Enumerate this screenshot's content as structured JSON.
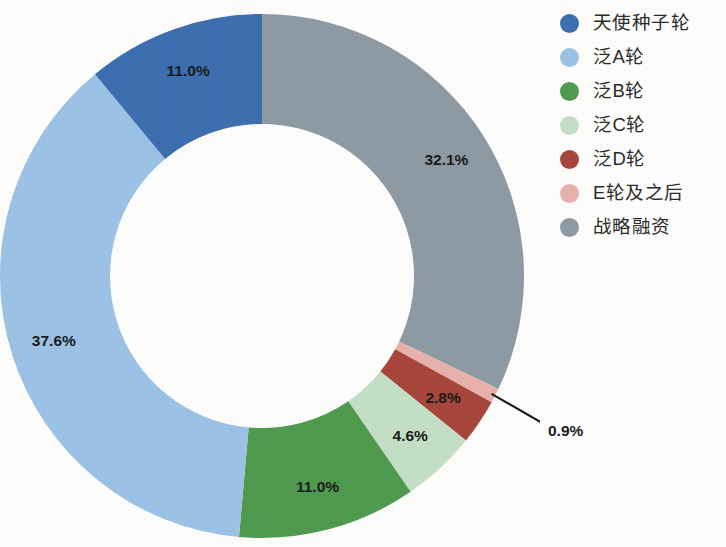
{
  "chart_data": {
    "type": "pie",
    "variant": "donut",
    "title": "",
    "subtitle": "",
    "xlabel": "",
    "ylabel": "",
    "grid": false,
    "legend_position": "right",
    "start_angle_deg": 0,
    "direction": "clockwise",
    "value_unit": "%",
    "center": {
      "x": 262,
      "y": 276
    },
    "outer_radius": 262,
    "inner_radius": 152,
    "categories": [
      "天使种子轮",
      "泛A轮",
      "泛B轮",
      "泛C轮",
      "泛D轮",
      "E轮及之后",
      "战略融资"
    ],
    "values": [
      11.0,
      37.6,
      11.0,
      4.6,
      2.8,
      0.9,
      32.1
    ],
    "labels": [
      "11.0%",
      "37.6%",
      "11.0%",
      "4.6%",
      "2.8%",
      "0.9%",
      "32.1%"
    ],
    "colors": [
      "#3d6fb0",
      "#9cc3e6",
      "#4f9b4f",
      "#c3e0c6",
      "#a8463c",
      "#e8b1ab",
      "#8e9aa4"
    ],
    "slices": [
      {
        "name": "战略融资",
        "value": 32.1,
        "label": "32.1%",
        "color": "#8e9aa4",
        "label_placement": "inside"
      },
      {
        "name": "E轮及之后",
        "value": 0.9,
        "label": "0.9%",
        "color": "#e8b1ab",
        "label_placement": "callout"
      },
      {
        "name": "泛D轮",
        "value": 2.8,
        "label": "2.8%",
        "color": "#a8463c",
        "label_placement": "inside"
      },
      {
        "name": "泛C轮",
        "value": 4.6,
        "label": "4.6%",
        "color": "#c3e0c6",
        "label_placement": "inside"
      },
      {
        "name": "泛B轮",
        "value": 11.0,
        "label": "11.0%",
        "color": "#4f9b4f",
        "label_placement": "inside"
      },
      {
        "name": "泛A轮",
        "value": 37.6,
        "label": "37.6%",
        "color": "#9cc3e6",
        "label_placement": "inside"
      },
      {
        "name": "天使种子轮",
        "value": 11.0,
        "label": "11.0%",
        "color": "#3d6fb0",
        "label_placement": "inside"
      }
    ]
  },
  "legend": {
    "items": [
      {
        "label": "天使种子轮",
        "color": "#3d6fb0"
      },
      {
        "label": "泛A轮",
        "color": "#9cc3e6"
      },
      {
        "label": "泛B轮",
        "color": "#4f9b4f"
      },
      {
        "label": "泛C轮",
        "color": "#c3e0c6"
      },
      {
        "label": "泛D轮",
        "color": "#a8463c"
      },
      {
        "label": "E轮及之后",
        "color": "#e8b1ab"
      },
      {
        "label": "战略融资",
        "color": "#8e9aa4"
      }
    ]
  },
  "labels_on_chart": {
    "seed": "11.0%",
    "strategic": "32.1%",
    "round_a": "37.6%",
    "round_b": "11.0%",
    "round_c": "4.6%",
    "round_d": "2.8%",
    "round_e": "0.9%"
  }
}
